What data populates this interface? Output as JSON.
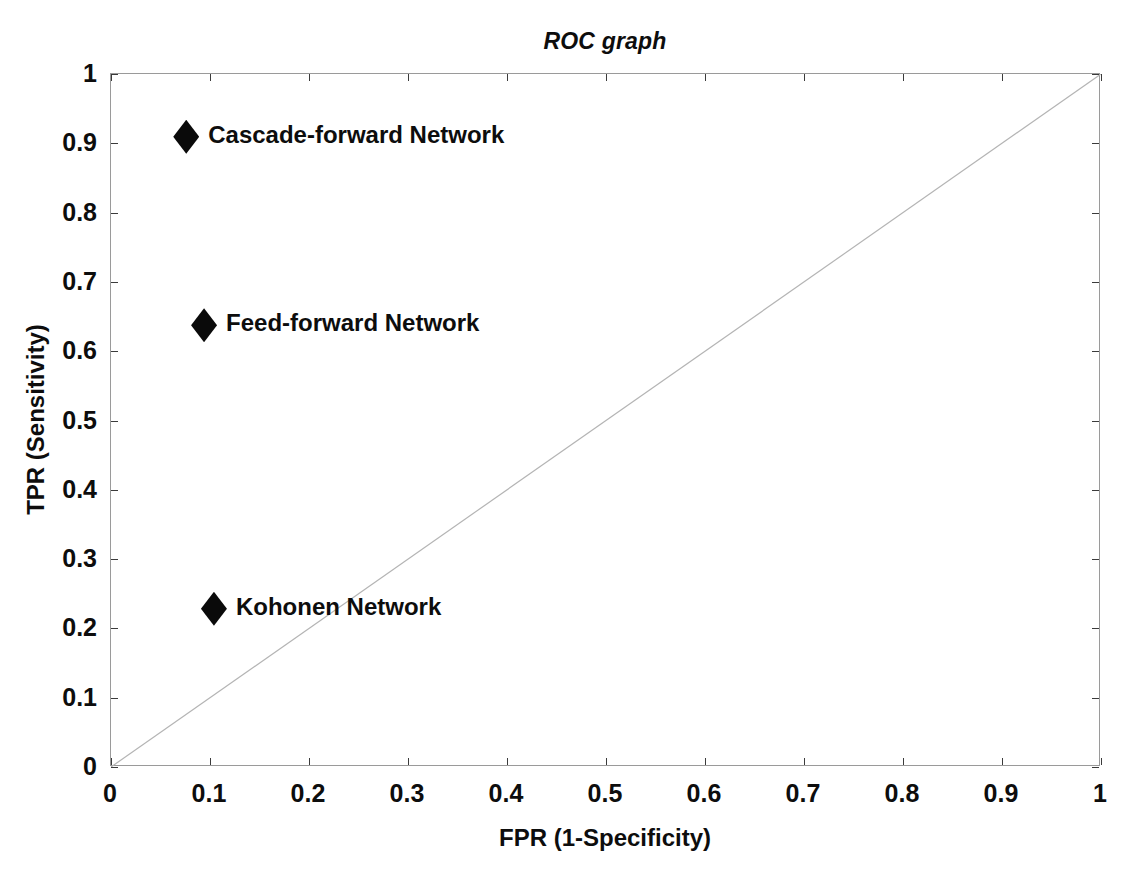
{
  "chart_data": {
    "type": "scatter",
    "title": "ROC graph",
    "xlabel": "FPR (1-Specificity)",
    "ylabel": "TPR (Sensitivity)",
    "xlim": [
      0,
      1
    ],
    "ylim": [
      0,
      1
    ],
    "grid": false,
    "legend": "none (points labeled inline)",
    "xticks": [
      "0",
      "0.1",
      "0.2",
      "0.3",
      "0.4",
      "0.5",
      "0.6",
      "0.7",
      "0.8",
      "0.9",
      "1"
    ],
    "yticks": [
      "0",
      "0.1",
      "0.2",
      "0.3",
      "0.4",
      "0.5",
      "0.6",
      "0.7",
      "0.8",
      "0.9",
      "1"
    ],
    "xtick_values": [
      0,
      0.1,
      0.2,
      0.3,
      0.4,
      0.5,
      0.6,
      0.7,
      0.8,
      0.9,
      1
    ],
    "ytick_values": [
      0,
      0.1,
      0.2,
      0.3,
      0.4,
      0.5,
      0.6,
      0.7,
      0.8,
      0.9,
      1
    ],
    "points": [
      {
        "label": "Cascade-forward Network",
        "x": 0.077,
        "y": 0.908,
        "marker": "diamond",
        "color": "#0a0a0a"
      },
      {
        "label": "Feed-forward Network",
        "x": 0.095,
        "y": 0.636,
        "marker": "diamond",
        "color": "#0a0a0a"
      },
      {
        "label": "Kohonen Network",
        "x": 0.105,
        "y": 0.227,
        "marker": "diamond",
        "color": "#0a0a0a"
      }
    ],
    "reference_line": {
      "name": "chance-diagonal",
      "from": [
        0,
        0
      ],
      "to": [
        1,
        1
      ],
      "color": "#b4b4b4",
      "width": 1
    },
    "axes_color": "#9a9a9a",
    "background": "#ffffff"
  }
}
